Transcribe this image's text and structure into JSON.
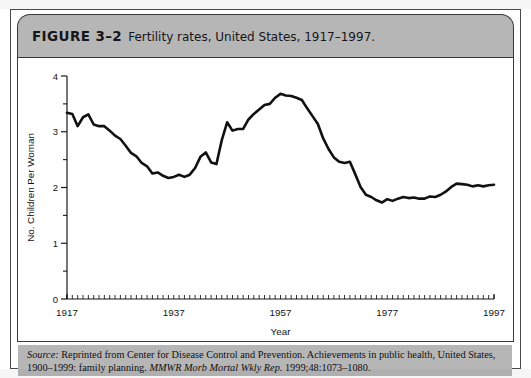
{
  "figure": {
    "label": "FIGURE 3–2",
    "title": "Fertility rates, United States, 1917–1997.",
    "source_prefix": "Source:",
    "source_text_1": " Reprinted from Center for Disease Control and Prevention. Achievements in public health, United States, 1900–1999: family planning. ",
    "source_italic": "MMWR Morb Mortal Wkly Rep.",
    "source_text_2": " 1999;48:1073–1080."
  },
  "colors": {
    "header_gray": "#b6b6b6",
    "frame_border": "#3a3a3a",
    "line": "#111111",
    "panel_background": "#ffffff"
  },
  "chart_data": {
    "type": "line",
    "title": "Fertility rates, United States, 1917–1997",
    "xlabel": "Year",
    "ylabel": "No. Children Per Woman",
    "xlim": [
      1917,
      1997
    ],
    "ylim": [
      0,
      4
    ],
    "xticks": [
      1917,
      1937,
      1957,
      1977,
      1997
    ],
    "xtick_labels": [
      "1917",
      "1937",
      "1957",
      "1977",
      "1997"
    ],
    "x_minor_tick_interval": 1,
    "yticks": [
      0,
      1,
      2,
      3,
      4
    ],
    "ytick_labels": [
      "0",
      "1",
      "2",
      "3",
      "4"
    ],
    "y_minor_tick_interval": 0.5,
    "grid": false,
    "legend": null,
    "series": [
      {
        "name": "Fertility rate",
        "x": [
          1917,
          1918,
          1919,
          1920,
          1921,
          1922,
          1923,
          1924,
          1925,
          1926,
          1927,
          1928,
          1929,
          1930,
          1931,
          1932,
          1933,
          1934,
          1935,
          1936,
          1937,
          1938,
          1939,
          1940,
          1941,
          1942,
          1943,
          1944,
          1945,
          1946,
          1947,
          1948,
          1949,
          1950,
          1951,
          1952,
          1953,
          1954,
          1955,
          1956,
          1957,
          1958,
          1959,
          1960,
          1961,
          1962,
          1963,
          1964,
          1965,
          1966,
          1967,
          1968,
          1969,
          1970,
          1971,
          1972,
          1973,
          1974,
          1975,
          1976,
          1977,
          1978,
          1979,
          1980,
          1981,
          1982,
          1983,
          1984,
          1985,
          1986,
          1987,
          1988,
          1989,
          1990,
          1991,
          1992,
          1993,
          1994,
          1995,
          1996,
          1997
        ],
        "y": [
          3.34,
          3.32,
          3.1,
          3.26,
          3.31,
          3.13,
          3.1,
          3.1,
          3.02,
          2.93,
          2.87,
          2.75,
          2.62,
          2.56,
          2.44,
          2.38,
          2.25,
          2.27,
          2.21,
          2.17,
          2.19,
          2.23,
          2.19,
          2.23,
          2.35,
          2.55,
          2.63,
          2.45,
          2.42,
          2.85,
          3.17,
          3.02,
          3.05,
          3.05,
          3.22,
          3.32,
          3.4,
          3.48,
          3.5,
          3.61,
          3.68,
          3.65,
          3.64,
          3.61,
          3.57,
          3.42,
          3.28,
          3.14,
          2.88,
          2.69,
          2.54,
          2.46,
          2.44,
          2.46,
          2.24,
          2.01,
          1.87,
          1.83,
          1.77,
          1.73,
          1.79,
          1.76,
          1.8,
          1.83,
          1.81,
          1.82,
          1.8,
          1.8,
          1.84,
          1.83,
          1.87,
          1.93,
          2.01,
          2.07,
          2.06,
          2.05,
          2.02,
          2.04,
          2.02,
          2.04,
          2.05
        ]
      }
    ]
  }
}
